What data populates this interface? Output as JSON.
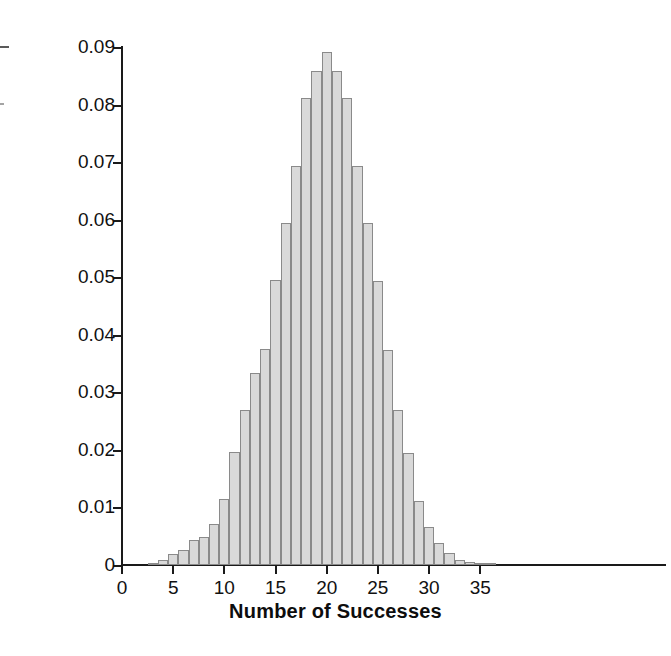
{
  "chart_data": {
    "type": "bar",
    "title": "",
    "subtitle": "",
    "xlabel": "Number of Successes",
    "ylabel": "Probability",
    "xlim": [
      0,
      42.5
    ],
    "ylim": [
      0,
      0.09
    ],
    "grid": false,
    "legend": null,
    "annotations": [],
    "xticks": [
      0,
      5,
      10,
      15,
      20,
      25,
      30,
      35
    ],
    "xtick_labels": [
      "0",
      "5",
      "10",
      "15",
      "20",
      "25",
      "30",
      "35"
    ],
    "yticks": [
      0,
      0.01,
      0.02,
      0.03,
      0.04,
      0.05,
      0.06,
      0.07,
      0.08,
      0.09
    ],
    "ytick_labels": [
      "0",
      "0.01",
      "0.02",
      "0.03",
      "0.04",
      "0.05",
      "0.06",
      "0.07",
      "0.08",
      "0.09"
    ],
    "bar_fill_color": "#d9d9d9",
    "bar_edge_color": "#8a8a8a",
    "axis_color": "#1a1a1a",
    "categories": [
      3,
      4,
      5,
      6,
      7,
      8,
      9,
      10,
      11,
      12,
      13,
      14,
      15,
      16,
      17,
      18,
      19,
      20,
      21,
      22,
      23,
      24,
      25,
      26,
      27,
      28,
      29,
      30,
      31,
      32,
      33,
      34,
      35,
      36
    ],
    "values": [
      0.0003,
      0.0009,
      0.0019,
      0.0026,
      0.0044,
      0.0048,
      0.0071,
      0.0114,
      0.0196,
      0.027,
      0.0334,
      0.0375,
      0.0495,
      0.0595,
      0.0694,
      0.0811,
      0.0859,
      0.0891,
      0.0858,
      0.0811,
      0.0694,
      0.0595,
      0.0494,
      0.0374,
      0.027,
      0.0194,
      0.0112,
      0.0066,
      0.0038,
      0.0021,
      0.0009,
      0.0005,
      0.0003,
      0.0002
    ]
  },
  "axes": {
    "x_title": "Number of Successes",
    "y_title": "Probability"
  }
}
